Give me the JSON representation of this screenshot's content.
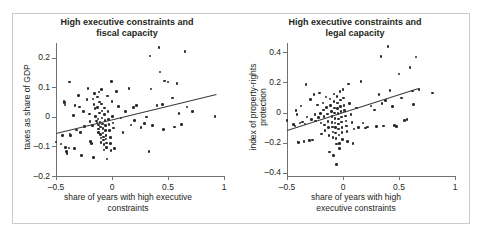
{
  "figure": {
    "border_color": "#c9cbcd",
    "background": "#ffffff",
    "point_color": "#2b2a29",
    "axis_color": "#6f7274"
  },
  "chart_data": [
    {
      "type": "scatter",
      "panel": "left",
      "title": "High executive constraints and fiscal capacity",
      "title_line1": "High executive constraints and",
      "title_line2": "fiscal capacity",
      "xlabel": "share of years with high executive constraints",
      "xlabel_line1": "share of years with high executive",
      "xlabel_line2": "constraints",
      "ylabel": "taxes as share of GDP",
      "xlim": [
        -0.5,
        1.0
      ],
      "ylim": [
        -0.2,
        0.25
      ],
      "xticks": [
        -0.5,
        0,
        0.5,
        1
      ],
      "xticklabels": [
        "–0.5",
        "0",
        "0.5",
        "1"
      ],
      "yticks": [
        0.2,
        0.1,
        0,
        -0.1,
        -0.2
      ],
      "yticklabels": [
        "0.2",
        "0.1",
        "0",
        "–0.1",
        "–0.2"
      ],
      "grid": false,
      "legend": null,
      "fit_line": {
        "x0": -0.5,
        "y0": -0.055,
        "x1": 0.93,
        "y1": 0.077
      },
      "points": [
        [
          -0.5,
          -0.085
        ],
        [
          -0.455,
          -0.092
        ],
        [
          -0.44,
          -0.062
        ],
        [
          -0.43,
          0.052
        ],
        [
          -0.425,
          0.048
        ],
        [
          -0.42,
          0.04
        ],
        [
          -0.415,
          -0.103
        ],
        [
          -0.405,
          -0.118
        ],
        [
          -0.4,
          -0.124
        ],
        [
          -0.385,
          -0.105
        ],
        [
          -0.38,
          0.118
        ],
        [
          -0.375,
          -0.058
        ],
        [
          -0.37,
          -0.063
        ],
        [
          -0.345,
          0.005
        ],
        [
          -0.335,
          -0.107
        ],
        [
          -0.33,
          0.038
        ],
        [
          -0.315,
          -0.045
        ],
        [
          -0.3,
          0.072
        ],
        [
          -0.29,
          0.034
        ],
        [
          -0.28,
          -0.052
        ],
        [
          -0.27,
          -0.131
        ],
        [
          -0.255,
          0.018
        ],
        [
          -0.245,
          -0.033
        ],
        [
          -0.225,
          0.058
        ],
        [
          -0.215,
          0.096
        ],
        [
          -0.2,
          0.01
        ],
        [
          -0.195,
          -0.016
        ],
        [
          -0.19,
          -0.083
        ],
        [
          -0.185,
          -0.09
        ],
        [
          -0.175,
          -0.03
        ],
        [
          -0.17,
          0.06
        ],
        [
          -0.165,
          -0.138
        ],
        [
          -0.16,
          0.041
        ],
        [
          -0.155,
          0.079
        ],
        [
          -0.15,
          0.028
        ],
        [
          -0.145,
          0.001
        ],
        [
          -0.14,
          -0.014
        ],
        [
          -0.135,
          -0.021
        ],
        [
          -0.13,
          0.067
        ],
        [
          -0.128,
          0.032
        ],
        [
          -0.125,
          -0.007
        ],
        [
          -0.122,
          -0.028
        ],
        [
          -0.12,
          -0.041
        ],
        [
          -0.118,
          -0.052
        ],
        [
          -0.115,
          0.084
        ],
        [
          -0.112,
          0.05
        ],
        [
          -0.11,
          0.013
        ],
        [
          -0.108,
          -0.018
        ],
        [
          -0.105,
          -0.034
        ],
        [
          -0.102,
          -0.06
        ],
        [
          -0.1,
          -0.072
        ],
        [
          -0.098,
          -0.086
        ],
        [
          -0.095,
          0.092
        ],
        [
          -0.092,
          0.044
        ],
        [
          -0.09,
          0.02
        ],
        [
          -0.088,
          -0.004
        ],
        [
          -0.085,
          -0.024
        ],
        [
          -0.082,
          -0.04
        ],
        [
          -0.08,
          -0.055
        ],
        [
          -0.078,
          -0.068
        ],
        [
          -0.075,
          -0.078
        ],
        [
          -0.072,
          -0.094
        ],
        [
          -0.07,
          -0.112
        ],
        [
          -0.068,
          0.03
        ],
        [
          -0.065,
          0.008
        ],
        [
          -0.062,
          -0.012
        ],
        [
          -0.06,
          -0.03
        ],
        [
          -0.058,
          -0.046
        ],
        [
          -0.055,
          -0.062
        ],
        [
          -0.052,
          -0.075
        ],
        [
          -0.05,
          -0.088
        ],
        [
          -0.048,
          -0.104
        ],
        [
          -0.045,
          -0.142
        ],
        [
          -0.04,
          0.07
        ],
        [
          -0.035,
          0.019
        ],
        [
          -0.03,
          -0.008
        ],
        [
          -0.025,
          -0.026
        ],
        [
          -0.02,
          -0.047
        ],
        [
          -0.015,
          -0.07
        ],
        [
          -0.012,
          -0.091
        ],
        [
          -0.008,
          -0.113
        ],
        [
          -0.005,
          0.12
        ],
        [
          0.0,
          0.053
        ],
        [
          0.005,
          0.002
        ],
        [
          0.01,
          -0.02
        ],
        [
          0.015,
          -0.038
        ],
        [
          0.02,
          -0.106
        ],
        [
          0.04,
          0.086
        ],
        [
          0.06,
          0.036
        ],
        [
          0.08,
          -0.004
        ],
        [
          0.1,
          -0.052
        ],
        [
          0.12,
          0.018
        ],
        [
          0.15,
          0.096
        ],
        [
          0.17,
          -0.028
        ],
        [
          0.19,
          0.032
        ],
        [
          0.2,
          -0.012
        ],
        [
          0.22,
          0.038
        ],
        [
          0.26,
          -0.036
        ],
        [
          0.29,
          -0.022
        ],
        [
          0.31,
          0.0
        ],
        [
          0.33,
          -0.118
        ],
        [
          0.34,
          0.206
        ],
        [
          0.35,
          0.094
        ],
        [
          0.36,
          -0.03
        ],
        [
          0.4,
          0.038
        ],
        [
          0.42,
          0.235
        ],
        [
          0.43,
          0.152
        ],
        [
          0.45,
          0.042
        ],
        [
          0.46,
          -0.042
        ],
        [
          0.47,
          0.122
        ],
        [
          0.5,
          0.118
        ],
        [
          0.54,
          0.064
        ],
        [
          0.56,
          -0.034
        ],
        [
          0.58,
          0.112
        ],
        [
          0.6,
          0.012
        ],
        [
          0.62,
          -0.026
        ],
        [
          0.65,
          0.222
        ],
        [
          0.67,
          0.033
        ],
        [
          0.72,
          0.018
        ],
        [
          0.92,
          0.002
        ]
      ]
    },
    {
      "type": "scatter",
      "panel": "right",
      "title": "High executive constraints and legal capacity",
      "title_line1": "High executive constraints and",
      "title_line2": "legal capacity",
      "xlabel": "share of years with high executive constraints",
      "xlabel_line1": "share of years with high",
      "xlabel_line2": "executive constraints",
      "ylabel": "index of property-rights protection",
      "ylabel_line1": "index of property-rights",
      "ylabel_line2": "protection",
      "xlim": [
        -0.5,
        1.0
      ],
      "ylim": [
        -0.42,
        0.46
      ],
      "xticks": [
        -0.5,
        0,
        0.5,
        1
      ],
      "xticklabels": [
        "–0.5",
        "0",
        "0.5",
        "1"
      ],
      "yticks": [
        0.4,
        0.2,
        0,
        -0.2,
        -0.4
      ],
      "yticklabels": [
        "0.4",
        "0.2",
        "0",
        "–0.2",
        "–0.4"
      ],
      "grid": false,
      "legend": null,
      "fit_line": {
        "x0": -0.5,
        "y0": -0.115,
        "x1": 0.67,
        "y1": 0.162
      },
      "points": [
        [
          -0.5,
          -0.052
        ],
        [
          -0.44,
          -0.078
        ],
        [
          -0.43,
          -0.088
        ],
        [
          -0.42,
          0.012
        ],
        [
          -0.41,
          -0.012
        ],
        [
          -0.4,
          -0.195
        ],
        [
          -0.395,
          -0.2
        ],
        [
          -0.385,
          -0.068
        ],
        [
          -0.375,
          0.042
        ],
        [
          -0.36,
          -0.062
        ],
        [
          -0.35,
          -0.19
        ],
        [
          -0.34,
          -0.076
        ],
        [
          -0.33,
          0.186
        ],
        [
          -0.32,
          -0.03
        ],
        [
          -0.3,
          -0.186
        ],
        [
          -0.29,
          0.086
        ],
        [
          -0.28,
          -0.048
        ],
        [
          -0.27,
          -0.182
        ],
        [
          -0.26,
          0.118
        ],
        [
          -0.25,
          -0.012
        ],
        [
          -0.245,
          -0.056
        ],
        [
          -0.23,
          0.05
        ],
        [
          -0.22,
          -0.034
        ],
        [
          -0.21,
          0.128
        ],
        [
          -0.2,
          -0.005
        ],
        [
          -0.195,
          -0.07
        ],
        [
          -0.19,
          -0.142
        ],
        [
          -0.18,
          0.062
        ],
        [
          -0.175,
          0.016
        ],
        [
          -0.17,
          -0.025
        ],
        [
          -0.165,
          -0.082
        ],
        [
          -0.16,
          -0.118
        ],
        [
          -0.15,
          0.104
        ],
        [
          -0.145,
          0.032
        ],
        [
          -0.14,
          -0.01
        ],
        [
          -0.135,
          -0.06
        ],
        [
          -0.13,
          -0.1
        ],
        [
          -0.125,
          -0.152
        ],
        [
          -0.12,
          -0.262
        ],
        [
          -0.115,
          0.09
        ],
        [
          -0.11,
          0.046
        ],
        [
          -0.105,
          0.008
        ],
        [
          -0.1,
          -0.028
        ],
        [
          -0.098,
          -0.066
        ],
        [
          -0.095,
          -0.095
        ],
        [
          -0.09,
          -0.128
        ],
        [
          -0.088,
          -0.165
        ],
        [
          -0.085,
          -0.285
        ],
        [
          -0.082,
          0.122
        ],
        [
          -0.08,
          0.072
        ],
        [
          -0.078,
          0.03
        ],
        [
          -0.075,
          -0.002
        ],
        [
          -0.072,
          -0.038
        ],
        [
          -0.07,
          -0.07
        ],
        [
          -0.068,
          -0.1
        ],
        [
          -0.065,
          -0.135
        ],
        [
          -0.062,
          -0.17
        ],
        [
          -0.06,
          -0.208
        ],
        [
          -0.058,
          -0.345
        ],
        [
          -0.055,
          0.105
        ],
        [
          -0.05,
          0.062
        ],
        [
          -0.048,
          0.025
        ],
        [
          -0.045,
          -0.008
        ],
        [
          -0.042,
          -0.042
        ],
        [
          -0.04,
          -0.075
        ],
        [
          -0.038,
          -0.108
        ],
        [
          -0.035,
          -0.148
        ],
        [
          -0.032,
          -0.205
        ],
        [
          -0.03,
          -0.24
        ],
        [
          -0.025,
          0.14
        ],
        [
          -0.022,
          0.082
        ],
        [
          -0.02,
          0.04
        ],
        [
          -0.018,
          0.005
        ],
        [
          -0.015,
          -0.03
        ],
        [
          -0.012,
          -0.062
        ],
        [
          -0.01,
          -0.098
        ],
        [
          -0.008,
          -0.132
        ],
        [
          -0.005,
          -0.178
        ],
        [
          0.0,
          0.152
        ],
        [
          0.005,
          0.096
        ],
        [
          0.01,
          0.048
        ],
        [
          0.015,
          0.012
        ],
        [
          0.02,
          -0.022
        ],
        [
          0.025,
          -0.055
        ],
        [
          0.03,
          -0.088
        ],
        [
          0.035,
          -0.125
        ],
        [
          0.04,
          -0.19
        ],
        [
          0.05,
          0.19
        ],
        [
          0.06,
          0.06
        ],
        [
          0.07,
          -0.012
        ],
        [
          0.08,
          -0.065
        ],
        [
          0.09,
          -0.205
        ],
        [
          0.1,
          -0.108
        ],
        [
          0.12,
          0.03
        ],
        [
          0.14,
          -0.098
        ],
        [
          0.16,
          0.205
        ],
        [
          0.18,
          -0.07
        ],
        [
          0.2,
          -0.102
        ],
        [
          0.22,
          -0.096
        ],
        [
          0.25,
          0.042
        ],
        [
          0.28,
          0.018
        ],
        [
          0.3,
          -0.092
        ],
        [
          0.32,
          0.118
        ],
        [
          0.34,
          0.37
        ],
        [
          0.35,
          0.06
        ],
        [
          0.36,
          -0.088
        ],
        [
          0.38,
          0.078
        ],
        [
          0.4,
          0.435
        ],
        [
          0.42,
          0.145
        ],
        [
          0.44,
          0.038
        ],
        [
          0.46,
          -0.086
        ],
        [
          0.48,
          -0.092
        ],
        [
          0.5,
          0.255
        ],
        [
          0.52,
          0.096
        ],
        [
          0.55,
          -0.052
        ],
        [
          0.57,
          -0.048
        ],
        [
          0.6,
          0.298
        ],
        [
          0.62,
          0.142
        ],
        [
          0.63,
          0.052
        ],
        [
          0.65,
          0.368
        ],
        [
          0.68,
          0.152
        ],
        [
          0.8,
          0.128
        ]
      ]
    }
  ]
}
